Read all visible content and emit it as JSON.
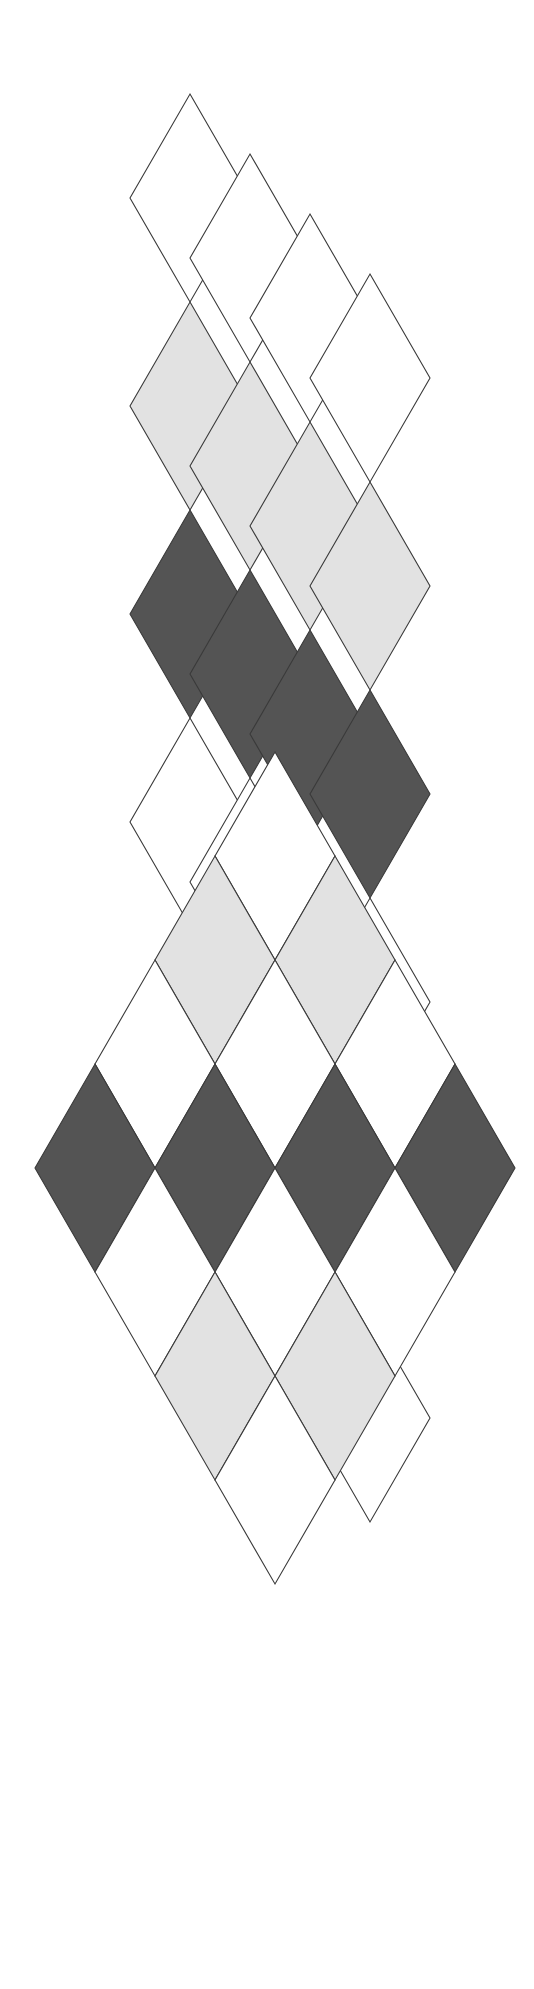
{
  "artwork": {
    "title": "Argyle Diamond Lattice Composition",
    "background_color": "#ffffff",
    "width": 534,
    "height": 1989,
    "palette": {
      "white": "#ffffff",
      "light_gray": "#e2e2e2",
      "dark_gray": "#545454",
      "outline": "#3a3a3a"
    },
    "stroke_width": 1.1,
    "diamond": {
      "half_width": 60,
      "half_height": 104
    },
    "groups": [
      {
        "id": "top-group",
        "name": "offset-staggered-columns",
        "description": "Four diamond columns, each shifted right and down from the previous, producing an overlapping cascade.",
        "column_offset": {
          "dx": 60,
          "dy": 60
        },
        "column_origin": {
          "x": 190,
          "y": 94
        },
        "column_count": 4,
        "cells_per_column": 6,
        "column_fills": [
          [
            "white",
            "light_gray",
            "dark_gray",
            "white",
            "light_gray",
            "white"
          ],
          [
            "white",
            "light_gray",
            "dark_gray",
            "white",
            "light_gray",
            "white"
          ],
          [
            "white",
            "light_gray",
            "dark_gray",
            "white",
            "light_gray",
            "white"
          ],
          [
            "white",
            "light_gray",
            "dark_gray",
            "white",
            "light_gray",
            "white"
          ]
        ]
      },
      {
        "id": "bottom-group",
        "name": "regular-argyle-lattice",
        "description": "A compact argyle lattice of diamonds arranged in a rotated-square silhouette.",
        "lattice_origin": {
          "x": 275,
          "y": 752
        },
        "rows": 5,
        "row_fills": [
          [
            "white"
          ],
          [
            "light_gray",
            "light_gray"
          ],
          [
            "white",
            "white",
            "white"
          ],
          [
            "dark_gray",
            "dark_gray",
            "dark_gray",
            "dark_gray"
          ],
          [
            "white",
            "white",
            "white"
          ],
          [
            "light_gray",
            "light_gray"
          ],
          [
            "white"
          ]
        ]
      }
    ]
  }
}
